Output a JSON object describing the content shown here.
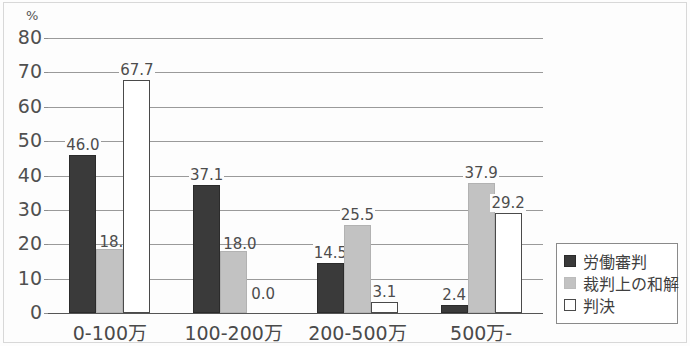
{
  "chart_data": {
    "type": "bar",
    "title": "",
    "xlabel": "",
    "ylabel": "%",
    "unit_label": "%",
    "ylim": [
      0,
      80
    ],
    "ytick_step": 10,
    "yticks": [
      "0",
      "10",
      "20",
      "30",
      "40",
      "50",
      "60",
      "70",
      "80"
    ],
    "grid": true,
    "legend_position": "right",
    "categories": [
      "0-100万",
      "100-200万",
      "200-500万",
      "500万-"
    ],
    "series": [
      {
        "name": "労働審判",
        "color": "#3a3a3a",
        "values": [
          46.0,
          37.1,
          14.5,
          2.4
        ],
        "labels": [
          "46.0",
          "37.1",
          "14.5",
          "2.4"
        ]
      },
      {
        "name": "裁判上の和解",
        "color": "#c2c2c2",
        "values": [
          18.6,
          18.0,
          25.5,
          37.9
        ],
        "labels": [
          "18.6",
          "18.0",
          "25.5",
          "37.9"
        ]
      },
      {
        "name": "判決",
        "color": "#ffffff",
        "values": [
          67.7,
          0.0,
          3.1,
          29.2
        ],
        "labels": [
          "67.7",
          "0.0",
          "3.1",
          "29.2"
        ]
      }
    ]
  },
  "legend": {
    "items": [
      {
        "label": "労働審判",
        "swatch": "dark-filled-square"
      },
      {
        "label": "裁判上の和解",
        "swatch": "gray-filled-square"
      },
      {
        "label": "判決",
        "swatch": "white-outlined-square"
      }
    ]
  }
}
